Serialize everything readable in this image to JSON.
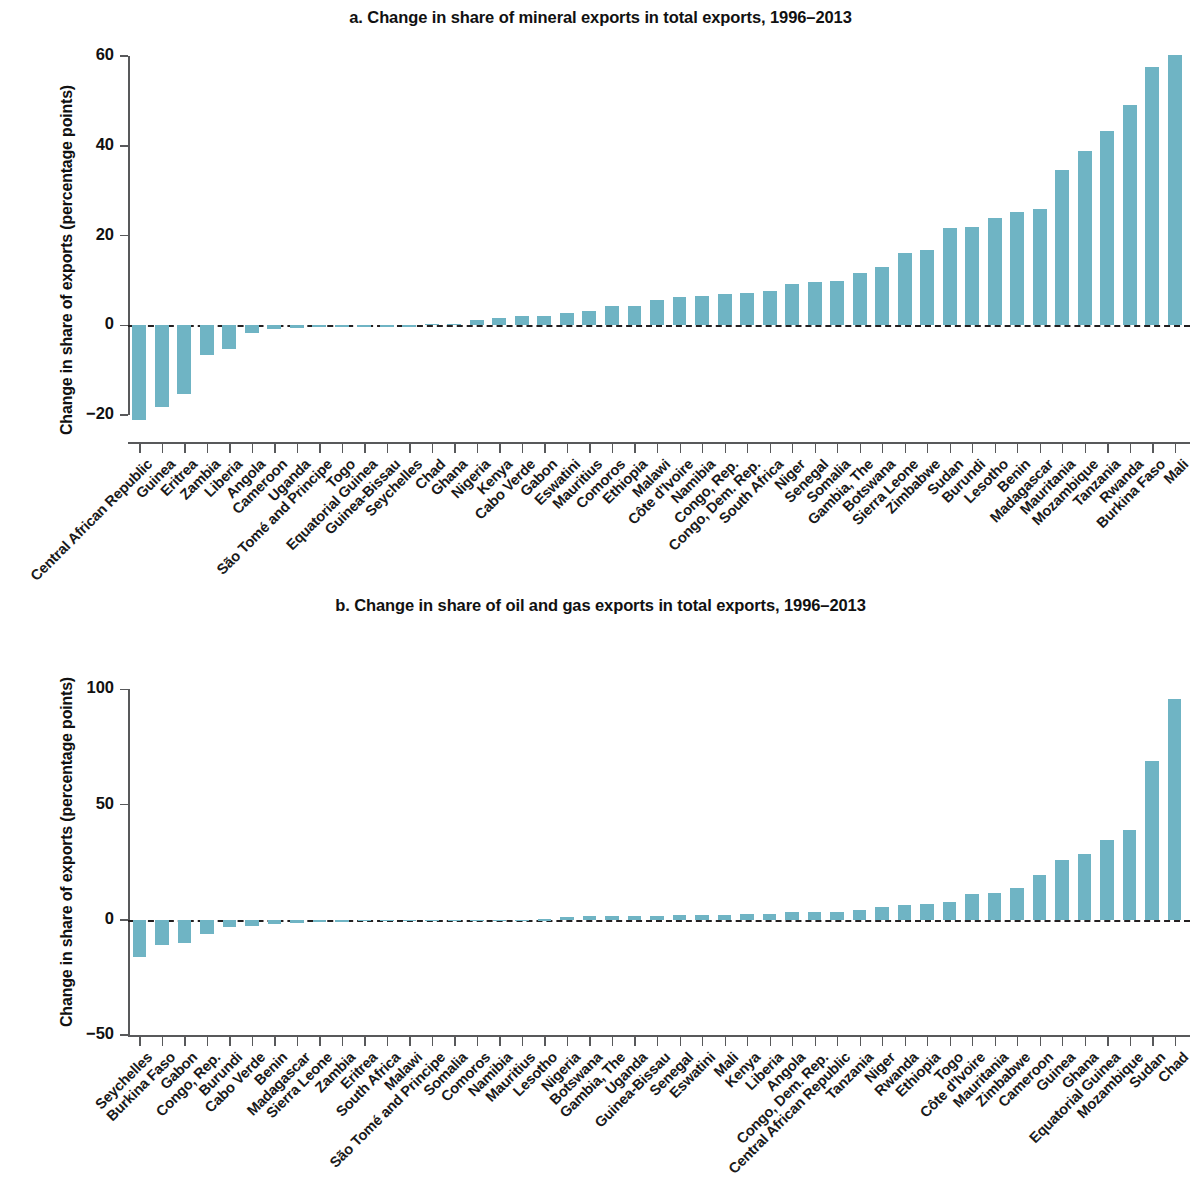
{
  "figure": {
    "background_color": "#ffffff",
    "bar_color": "#6fb4c4",
    "axis_color": "#58595b",
    "zero_line_color": "#231f20"
  },
  "panels": [
    {
      "id": "panel-a",
      "title": "a. Change in share of mineral exports in total exports, 1996–2013",
      "ylabel": "Change in share of exports (percentage points)",
      "yticks": [
        "60",
        "40",
        "20",
        "0",
        "−20"
      ]
    },
    {
      "id": "panel-b",
      "title": "b. Change in share of oil and gas exports in total exports, 1996–2013",
      "ylabel": "Change in share of exports (percentage points)",
      "yticks": [
        "100",
        "50",
        "0",
        "−50"
      ]
    }
  ],
  "chart_data": [
    {
      "type": "bar",
      "title": "a. Change in share of mineral exports in total exports, 1996–2013",
      "xlabel": "",
      "ylabel": "Change in share of exports (percentage points)",
      "ylim": [
        -26,
        62
      ],
      "yticks": [
        -20,
        0,
        20,
        40,
        60
      ],
      "grid": false,
      "legend": "none",
      "categories": [
        "Central African Republic",
        "Guinea",
        "Eritrea",
        "Zambia",
        "Liberia",
        "Angola",
        "Cameroon",
        "Uganda",
        "São Tomé and Principe",
        "Togo",
        "Equatorial Guinea",
        "Guinea-Bissau",
        "Seychelles",
        "Chad",
        "Ghana",
        "Nigeria",
        "Kenya",
        "Cabo Verde",
        "Gabon",
        "Eswatini",
        "Mauritius",
        "Comoros",
        "Ethiopia",
        "Malawi",
        "Côte d'Ivoire",
        "Namibia",
        "Congo, Rep.",
        "Congo, Dem. Rep.",
        "South Africa",
        "Niger",
        "Senegal",
        "Somalia",
        "Gambia, The",
        "Botswana",
        "Sierra Leone",
        "Zimbabwe",
        "Sudan",
        "Burundi",
        "Lesotho",
        "Benin",
        "Madagascar",
        "Mauritania",
        "Mozambique",
        "Tanzania",
        "Rwanda",
        "Burkina Faso",
        "Mali"
      ],
      "values": [
        -21.0,
        -18.2,
        -15.2,
        -6.6,
        -5.2,
        -1.8,
        -0.8,
        -0.5,
        -0.4,
        -0.3,
        -0.3,
        -0.2,
        -0.2,
        0.3,
        0.4,
        1.2,
        1.7,
        2.0,
        2.1,
        2.7,
        3.1,
        4.2,
        4.4,
        5.7,
        6.4,
        6.5,
        7.0,
        7.1,
        7.6,
        9.1,
        9.6,
        9.9,
        11.7,
        12.9,
        16.0,
        16.7,
        21.6,
        22.0,
        23.8,
        25.2,
        25.8,
        34.6,
        38.9,
        43.3,
        49.1,
        57.6,
        60.3
      ]
    },
    {
      "type": "bar",
      "title": "b. Change in share of oil and gas exports in total exports, 1996–2013",
      "xlabel": "",
      "ylabel": "Change in share of exports (percentage points)",
      "ylim": [
        -50,
        108
      ],
      "yticks": [
        -50,
        0,
        50,
        100
      ],
      "grid": false,
      "legend": "none",
      "categories": [
        "Seychelles",
        "Burkina Faso",
        "Gabon",
        "Congo, Rep.",
        "Burundi",
        "Cabo Verde",
        "Benin",
        "Madagascar",
        "Sierra Leone",
        "Zambia",
        "Eritrea",
        "South Africa",
        "Malawi",
        "São Tomé and Principe",
        "Somalia",
        "Comoros",
        "Namibia",
        "Mauritius",
        "Lesotho",
        "Nigeria",
        "Botswana",
        "Gambia, The",
        "Uganda",
        "Guinea-Bissau",
        "Senegal",
        "Eswatini",
        "Mali",
        "Kenya",
        "Liberia",
        "Angola",
        "Congo, Dem. Rep.",
        "Central African Republic",
        "Tanzania",
        "Niger",
        "Rwanda",
        "Ethiopia",
        "Togo",
        "Côte d'Ivoire",
        "Mauritania",
        "Zimbabwe",
        "Cameroon",
        "Guinea",
        "Ghana",
        "Equatorial Guinea",
        "Mozambique",
        "Sudan",
        "Chad"
      ],
      "values": [
        -16.0,
        -11.0,
        -10.2,
        -6.0,
        -3.1,
        -2.5,
        -1.7,
        -1.3,
        -1.1,
        -0.9,
        -0.7,
        -0.6,
        -0.5,
        -0.4,
        -0.3,
        -0.2,
        -0.2,
        -0.1,
        0.3,
        1.3,
        1.5,
        1.6,
        1.7,
        1.8,
        2.0,
        2.1,
        2.3,
        2.5,
        2.6,
        3.2,
        3.4,
        3.5,
        4.3,
        5.4,
        6.4,
        7.0,
        7.7,
        11.0,
        11.5,
        13.9,
        19.5,
        25.8,
        28.4,
        34.6,
        38.9,
        69.0,
        96.0
      ]
    }
  ]
}
